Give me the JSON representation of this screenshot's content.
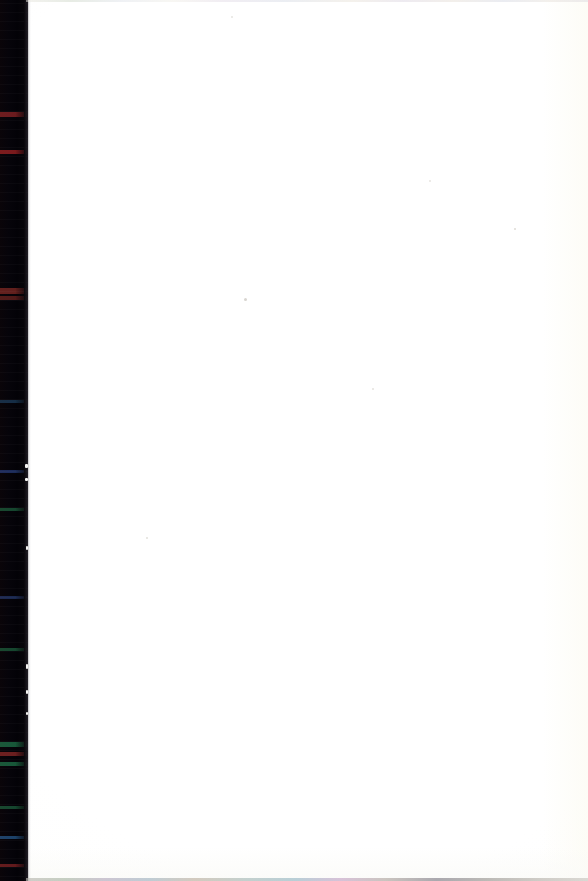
{
  "document": {
    "type": "scanned-page",
    "title": "Scanned blank page",
    "page_content_text": "",
    "visible_text": "",
    "note": "Blank white page; no text, headings, figures, tables or page numbers are visible."
  },
  "canvas": {
    "width_px": 588,
    "height_px": 881,
    "background_color": "#ffffff"
  },
  "page_surface": {
    "name": "paper",
    "color": "#ffffff",
    "right_margin_tint": "#fcfbf3",
    "bottom_margin_tint": "#fafaf7"
  },
  "gutter": {
    "name": "scanner-binding-shadow",
    "position": "left",
    "width_px": 28,
    "color": "#050406",
    "edge_color": "#0d0b10",
    "description": "Dark vertical binding/scanner gutter along the left edge with faint horizontal RGB scan-line noise.",
    "streaks": [
      {
        "y_px": 112,
        "height_px": 5,
        "color": "#7a1c1a"
      },
      {
        "y_px": 150,
        "height_px": 4,
        "color": "#8c1a18"
      },
      {
        "y_px": 288,
        "height_px": 6,
        "color": "#6e2018"
      },
      {
        "y_px": 296,
        "height_px": 4,
        "color": "#5a1a14"
      },
      {
        "y_px": 400,
        "height_px": 3,
        "color": "#13324a"
      },
      {
        "y_px": 470,
        "height_px": 3,
        "color": "#1a2f62"
      },
      {
        "y_px": 508,
        "height_px": 3,
        "color": "#14502e"
      },
      {
        "y_px": 596,
        "height_px": 3,
        "color": "#192b55"
      },
      {
        "y_px": 648,
        "height_px": 3,
        "color": "#14502e"
      },
      {
        "y_px": 742,
        "height_px": 5,
        "color": "#16643a"
      },
      {
        "y_px": 752,
        "height_px": 4,
        "color": "#7a201c"
      },
      {
        "y_px": 762,
        "height_px": 4,
        "color": "#16643a"
      },
      {
        "y_px": 806,
        "height_px": 3,
        "color": "#14502e"
      },
      {
        "y_px": 836,
        "height_px": 3,
        "color": "#1c4a74"
      },
      {
        "y_px": 864,
        "height_px": 3,
        "color": "#6e1a18"
      }
    ],
    "edge_specks": [
      {
        "x_px": 25,
        "y_px": 464,
        "w_px": 3,
        "h_px": 4
      },
      {
        "x_px": 25,
        "y_px": 478,
        "w_px": 3,
        "h_px": 3
      },
      {
        "x_px": 26,
        "y_px": 546,
        "w_px": 2,
        "h_px": 4
      },
      {
        "x_px": 26,
        "y_px": 664,
        "w_px": 2,
        "h_px": 5
      },
      {
        "x_px": 26,
        "y_px": 690,
        "w_px": 2,
        "h_px": 4
      },
      {
        "x_px": 26,
        "y_px": 712,
        "w_px": 2,
        "h_px": 3
      }
    ]
  },
  "fringe": {
    "top": {
      "name": "chromatic-fringe-top",
      "height_px": 2
    },
    "bottom": {
      "name": "chromatic-fringe-bottom",
      "height_px": 3
    }
  },
  "specks": [
    {
      "name": "dust-speck-1",
      "x_px": 244,
      "y_px": 298,
      "size_px": 3,
      "color": "#d8d5d0"
    },
    {
      "name": "dust-speck-2",
      "x_px": 514,
      "y_px": 228,
      "size_px": 2,
      "color": "#dedbd6"
    },
    {
      "name": "dust-speck-3",
      "x_px": 146,
      "y_px": 537,
      "size_px": 2,
      "color": "#e2e0db"
    },
    {
      "name": "dust-speck-4",
      "x_px": 372,
      "y_px": 388,
      "size_px": 2,
      "color": "#e4e2de"
    },
    {
      "name": "dust-speck-5",
      "x_px": 231,
      "y_px": 16,
      "size_px": 2,
      "color": "#e6e4e0"
    },
    {
      "name": "dust-speck-6",
      "x_px": 429,
      "y_px": 180,
      "size_px": 2,
      "color": "#e7e5e1"
    }
  ]
}
